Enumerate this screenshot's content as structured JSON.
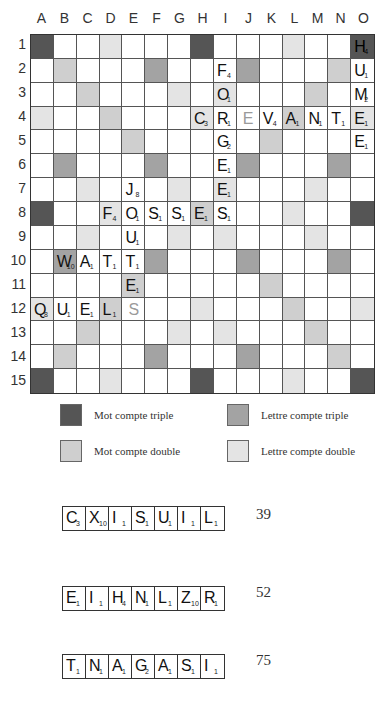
{
  "board": {
    "columns": [
      "A",
      "B",
      "C",
      "D",
      "E",
      "F",
      "G",
      "H",
      "I",
      "J",
      "K",
      "L",
      "M",
      "N",
      "O"
    ],
    "rows": [
      "1",
      "2",
      "3",
      "4",
      "5",
      "6",
      "7",
      "8",
      "9",
      "10",
      "11",
      "12",
      "13",
      "14",
      "15"
    ],
    "premium_squares": {
      "mot_compte_triple": [
        [
          1,
          1
        ],
        [
          1,
          8
        ],
        [
          1,
          15
        ],
        [
          8,
          1
        ],
        [
          8,
          15
        ],
        [
          15,
          1
        ],
        [
          15,
          8
        ],
        [
          15,
          15
        ]
      ],
      "mot_compte_double": [
        [
          2,
          2
        ],
        [
          3,
          3
        ],
        [
          4,
          4
        ],
        [
          5,
          5
        ],
        [
          2,
          14
        ],
        [
          3,
          13
        ],
        [
          4,
          12
        ],
        [
          5,
          11
        ],
        [
          11,
          5
        ],
        [
          12,
          4
        ],
        [
          13,
          3
        ],
        [
          14,
          2
        ],
        [
          11,
          11
        ],
        [
          12,
          12
        ],
        [
          13,
          13
        ],
        [
          14,
          14
        ],
        [
          8,
          8
        ]
      ],
      "lettre_compte_triple": [
        [
          2,
          6
        ],
        [
          2,
          10
        ],
        [
          6,
          2
        ],
        [
          6,
          6
        ],
        [
          6,
          10
        ],
        [
          6,
          14
        ],
        [
          10,
          2
        ],
        [
          10,
          6
        ],
        [
          10,
          10
        ],
        [
          10,
          14
        ],
        [
          14,
          6
        ],
        [
          14,
          10
        ]
      ],
      "lettre_compte_double": [
        [
          1,
          4
        ],
        [
          1,
          12
        ],
        [
          3,
          7
        ],
        [
          3,
          9
        ],
        [
          4,
          1
        ],
        [
          4,
          8
        ],
        [
          4,
          15
        ],
        [
          7,
          3
        ],
        [
          7,
          7
        ],
        [
          7,
          9
        ],
        [
          7,
          13
        ],
        [
          8,
          4
        ],
        [
          8,
          12
        ],
        [
          9,
          3
        ],
        [
          9,
          7
        ],
        [
          9,
          9
        ],
        [
          9,
          13
        ],
        [
          12,
          1
        ],
        [
          12,
          8
        ],
        [
          12,
          15
        ],
        [
          13,
          7
        ],
        [
          13,
          9
        ],
        [
          15,
          4
        ],
        [
          15,
          12
        ]
      ]
    },
    "tiles": [
      {
        "row": 1,
        "col": 15,
        "letter": "H",
        "points": "4"
      },
      {
        "row": 2,
        "col": 9,
        "letter": "F",
        "points": "4"
      },
      {
        "row": 2,
        "col": 15,
        "letter": "U",
        "points": "1"
      },
      {
        "row": 3,
        "col": 9,
        "letter": "O",
        "points": "1"
      },
      {
        "row": 3,
        "col": 15,
        "letter": "M",
        "points": "2"
      },
      {
        "row": 4,
        "col": 8,
        "letter": "C",
        "points": "3"
      },
      {
        "row": 4,
        "col": 9,
        "letter": "R",
        "points": "1"
      },
      {
        "row": 4,
        "col": 10,
        "letter": "E",
        "points": "",
        "blank": true
      },
      {
        "row": 4,
        "col": 11,
        "letter": "V",
        "points": "4"
      },
      {
        "row": 4,
        "col": 12,
        "letter": "A",
        "points": "1"
      },
      {
        "row": 4,
        "col": 13,
        "letter": "N",
        "points": "1"
      },
      {
        "row": 4,
        "col": 14,
        "letter": "T",
        "points": "1"
      },
      {
        "row": 4,
        "col": 15,
        "letter": "E",
        "points": "1"
      },
      {
        "row": 5,
        "col": 9,
        "letter": "G",
        "points": "2"
      },
      {
        "row": 5,
        "col": 15,
        "letter": "E",
        "points": "1"
      },
      {
        "row": 6,
        "col": 9,
        "letter": "E",
        "points": "1"
      },
      {
        "row": 7,
        "col": 5,
        "letter": "J",
        "points": "8"
      },
      {
        "row": 7,
        "col": 9,
        "letter": "E",
        "points": "1"
      },
      {
        "row": 8,
        "col": 4,
        "letter": "F",
        "points": "4"
      },
      {
        "row": 8,
        "col": 5,
        "letter": "O",
        "points": "1"
      },
      {
        "row": 8,
        "col": 6,
        "letter": "S",
        "points": "1"
      },
      {
        "row": 8,
        "col": 7,
        "letter": "S",
        "points": "1"
      },
      {
        "row": 8,
        "col": 8,
        "letter": "E",
        "points": "1"
      },
      {
        "row": 8,
        "col": 9,
        "letter": "S",
        "points": "1"
      },
      {
        "row": 9,
        "col": 5,
        "letter": "U",
        "points": "1"
      },
      {
        "row": 10,
        "col": 2,
        "letter": "W",
        "points": "10"
      },
      {
        "row": 10,
        "col": 3,
        "letter": "A",
        "points": "1"
      },
      {
        "row": 10,
        "col": 4,
        "letter": "T",
        "points": "1"
      },
      {
        "row": 10,
        "col": 5,
        "letter": "T",
        "points": "1"
      },
      {
        "row": 11,
        "col": 5,
        "letter": "E",
        "points": "1"
      },
      {
        "row": 12,
        "col": 1,
        "letter": "Q",
        "points": "8"
      },
      {
        "row": 12,
        "col": 2,
        "letter": "U",
        "points": "1"
      },
      {
        "row": 12,
        "col": 3,
        "letter": "E",
        "points": "1"
      },
      {
        "row": 12,
        "col": 4,
        "letter": "L",
        "points": "1"
      },
      {
        "row": 12,
        "col": 5,
        "letter": "S",
        "points": "",
        "blank": true
      }
    ]
  },
  "legend": [
    {
      "key": "mt",
      "label": "Mot compte triple",
      "color": "#555555"
    },
    {
      "key": "lt",
      "label": "Lettre compte triple",
      "color": "#a3a3a3"
    },
    {
      "key": "md",
      "label": "Mot compte double",
      "color": "#cfcfcf"
    },
    {
      "key": "ld",
      "label": "Lettre compte double",
      "color": "#e4e4e4"
    }
  ],
  "racks": [
    {
      "tiles": [
        {
          "letter": "C",
          "points": "3"
        },
        {
          "letter": "X",
          "points": "10"
        },
        {
          "letter": "I",
          "points": "1"
        },
        {
          "letter": "S",
          "points": "1"
        },
        {
          "letter": "U",
          "points": "1"
        },
        {
          "letter": "I",
          "points": "1"
        },
        {
          "letter": "L",
          "points": "1"
        }
      ],
      "score": "39"
    },
    {
      "tiles": [
        {
          "letter": "E",
          "points": "1"
        },
        {
          "letter": "I",
          "points": "1"
        },
        {
          "letter": "H",
          "points": "4"
        },
        {
          "letter": "N",
          "points": "1"
        },
        {
          "letter": "L",
          "points": "1"
        },
        {
          "letter": "Z",
          "points": "10"
        },
        {
          "letter": "R",
          "points": "1"
        }
      ],
      "score": "52"
    },
    {
      "tiles": [
        {
          "letter": "T",
          "points": "1"
        },
        {
          "letter": "N",
          "points": "1"
        },
        {
          "letter": "A",
          "points": "1"
        },
        {
          "letter": "G",
          "points": "2"
        },
        {
          "letter": "A",
          "points": "1"
        },
        {
          "letter": "S",
          "points": "1"
        },
        {
          "letter": "I",
          "points": "1"
        }
      ],
      "score": "75"
    }
  ]
}
